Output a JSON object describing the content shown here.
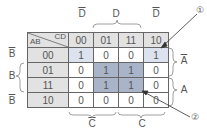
{
  "diagram": {
    "corner": {
      "row_var": "AB",
      "col_var": "CD"
    },
    "columns": [
      "00",
      "01",
      "11",
      "10"
    ],
    "rows": [
      {
        "label": "00",
        "cells": [
          "1",
          "0",
          "0",
          "1"
        ]
      },
      {
        "label": "01",
        "cells": [
          "0",
          "1",
          "1",
          "0"
        ]
      },
      {
        "label": "11",
        "cells": [
          "0",
          "1",
          "1",
          "0"
        ]
      },
      {
        "label": "10",
        "cells": [
          "0",
          "0",
          "0",
          "0"
        ]
      }
    ],
    "top_labels": {
      "d_bar_left": "D",
      "d_mid": "D",
      "d_bar_right": "D"
    },
    "left_labels": {
      "b_bar_top": "B",
      "b_mid": "B",
      "b_bar_bottom": "B"
    },
    "right_labels": {
      "a_bar": "A",
      "a": "A"
    },
    "bottom_labels": {
      "c_bar": "C",
      "c": "C"
    },
    "callouts": {
      "one": "①",
      "two": "②"
    },
    "colors": {
      "header": "#e2e2e2",
      "light_group": "#dde3ee",
      "dark_group": "#a9b4c9",
      "border": "#666666"
    }
  }
}
